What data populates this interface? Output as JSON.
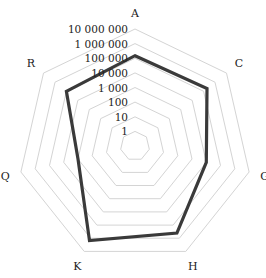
{
  "chart_data": {
    "type": "radar",
    "title": "",
    "scale": "log10",
    "categories": [
      "A",
      "C",
      "G",
      "H",
      "K",
      "Q",
      "R"
    ],
    "tick_labels": [
      "1",
      "10",
      "100",
      "1 000",
      "10 000",
      "100 000",
      "1 000 000",
      "10 000 000"
    ],
    "tick_values": [
      1,
      10,
      100,
      1000,
      10000,
      100000,
      1000000,
      10000000
    ],
    "range": [
      1,
      10000000
    ],
    "grid": true,
    "legend": "none",
    "series": [
      {
        "name": "series-1",
        "color": "#3a3a3a",
        "values": [
          150000,
          200000,
          10000,
          400000,
          1500000,
          1000,
          100000
        ]
      }
    ]
  },
  "colors": {
    "grid": "#d4d4d4",
    "series": "#3a3a3a",
    "text": "#222222",
    "background": "#ffffff"
  }
}
